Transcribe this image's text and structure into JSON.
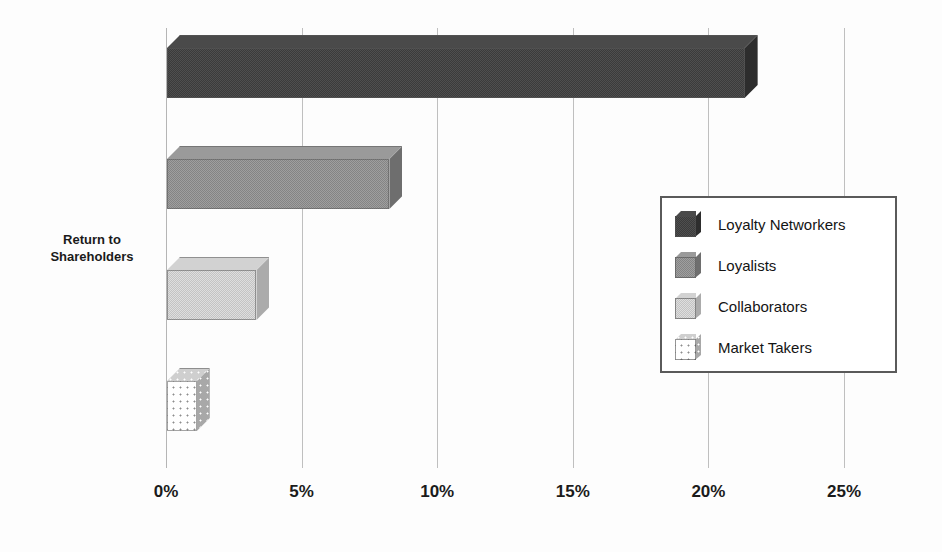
{
  "chart_data": {
    "type": "bar",
    "orientation": "horizontal",
    "title": "",
    "xlabel": "",
    "ylabel": "Return to Shareholders",
    "categories": [
      "Return to Shareholders"
    ],
    "series": [
      {
        "name": "Loyalty Networkers",
        "values": [
          21.3
        ],
        "swatch": "dark-dither"
      },
      {
        "name": "Loyalists",
        "values": [
          8.2
        ],
        "swatch": "medium-dither"
      },
      {
        "name": "Collaborators",
        "values": [
          3.3
        ],
        "swatch": "light-dither"
      },
      {
        "name": "Market Takers",
        "values": [
          1.1
        ],
        "swatch": "dotted-white"
      }
    ],
    "xlim": [
      0,
      25
    ],
    "xticks": [
      0,
      5,
      10,
      15,
      20,
      25
    ],
    "xtick_labels": [
      "0%",
      "5%",
      "10%",
      "15%",
      "20%",
      "25%"
    ],
    "grid": true,
    "legend_position": "center-right",
    "legend_entries": [
      "Loyalty Networkers",
      "Loyalists",
      "Collaborators",
      "Market Takers"
    ],
    "style": "3d-bar",
    "colors": {
      "bar_loyalty_networkers": "#3b3b3b",
      "bar_loyalists": "#848484",
      "bar_collaborators": "#c3c3c3",
      "bar_market_takers": "#ffffff",
      "gridline": "#bfbfbf",
      "legend_border": "#5a5a5a",
      "background": "#fdfdfd",
      "text": "#1a1a1a"
    }
  },
  "axis": {
    "category_label_line1": "Return to",
    "category_label_line2": "Shareholders"
  }
}
